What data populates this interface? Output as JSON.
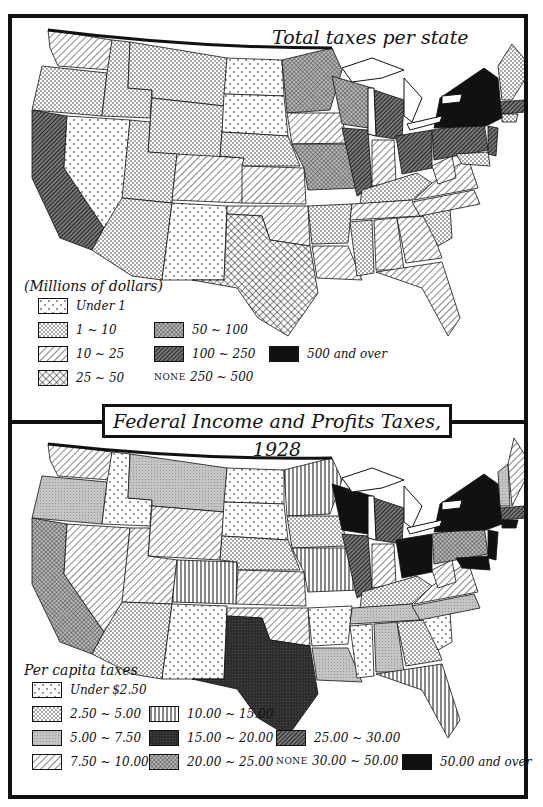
{
  "main_title": "Federal Income and Profits Taxes, 1928",
  "top_map": {
    "title": "Total taxes per state",
    "legend_heading": "(Millions of dollars)",
    "legend": [
      {
        "label": "Under 1",
        "pattern": "sparse-dots"
      },
      {
        "label": "1 ~ 10",
        "pattern": "dense-dots"
      },
      {
        "label": "10 ~ 25",
        "pattern": "diagonal-lines"
      },
      {
        "label": "25 ~ 50",
        "pattern": "crosshatch"
      },
      {
        "label": "50 ~ 100",
        "pattern": "fine-crosshatch-gray"
      },
      {
        "label": "100 ~ 250",
        "pattern": "dense-diagonal-dark"
      },
      {
        "label": "250 ~ 500",
        "pattern": "none",
        "note": "NONE"
      },
      {
        "label": "500 and over",
        "pattern": "solid-black"
      }
    ]
  },
  "bottom_map": {
    "legend_heading": "Per capita taxes",
    "legend": [
      {
        "label": "Under $2.50",
        "pattern": "sparse-dots"
      },
      {
        "label": "2.50 ~ 5.00",
        "pattern": "dense-dots"
      },
      {
        "label": "5.00 ~ 7.50",
        "pattern": "light-gray"
      },
      {
        "label": "7.50 ~ 10.00",
        "pattern": "diagonal-lines"
      },
      {
        "label": "10.00 ~ 15.00",
        "pattern": "vertical-lines"
      },
      {
        "label": "15.00 ~ 20.00",
        "pattern": "dark-gray-solid"
      },
      {
        "label": "20.00 ~ 25.00",
        "pattern": "fine-crosshatch-gray"
      },
      {
        "label": "25.00 ~ 30.00",
        "pattern": "dense-diagonal-dark"
      },
      {
        "label": "30.00 ~ 50.00",
        "pattern": "none",
        "note": "NONE"
      },
      {
        "label": "50.00 and over",
        "pattern": "solid-black"
      }
    ]
  },
  "colors": {
    "ink": "#111111",
    "paper": "#ffffff",
    "gray": "#9a9a9a",
    "dark": "#333333"
  }
}
